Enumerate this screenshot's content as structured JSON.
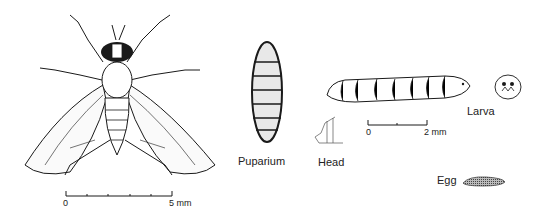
{
  "figure": {
    "specimens": [
      {
        "id": "adult",
        "name": "Adult fly (dorsal view)"
      },
      {
        "id": "puparium",
        "label": "Puparium"
      },
      {
        "id": "larva",
        "label": "Larva"
      },
      {
        "id": "head",
        "label": "Head"
      },
      {
        "id": "egg",
        "label": "Egg"
      }
    ],
    "scale_bars": {
      "adult": {
        "start": "0",
        "end": "5 mm",
        "ticks": 6
      },
      "larva": {
        "start": "0",
        "end": "2 mm",
        "ticks": 3
      }
    }
  },
  "colors": {
    "ink": "#1a1a1a",
    "background": "#ffffff"
  }
}
